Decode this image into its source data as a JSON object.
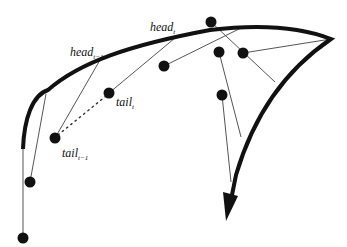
{
  "diagram": {
    "type": "tracking-curve",
    "colors": {
      "curve": "#111111",
      "line": "#555555",
      "dot": "#111111",
      "background": "#ffffff"
    },
    "labels": {
      "head_t": {
        "base": "head",
        "sub": "t"
      },
      "head_tm1": {
        "base": "head",
        "sub": "t−1"
      },
      "tail_t": {
        "base": "tail",
        "sub": "t"
      },
      "tail_tm1": {
        "base": "tail",
        "sub": "t−1"
      }
    },
    "curve": {
      "description": "Thick path starting lower-left, curving up and right to a sharp tip, then sweeping down to an arrowhead",
      "start": [
        23,
        149
      ],
      "tip": [
        331,
        39
      ],
      "arrow_tip": [
        226,
        221
      ]
    },
    "dots": [
      {
        "id": "tail_t",
        "x": 109,
        "y": 93
      },
      {
        "id": "tail_tm1",
        "x": 55,
        "y": 138
      },
      {
        "id": "d1",
        "x": 30,
        "y": 182
      },
      {
        "id": "d2",
        "x": 23,
        "y": 238
      },
      {
        "id": "d3",
        "x": 164,
        "y": 66
      },
      {
        "id": "d4",
        "x": 211,
        "y": 22
      },
      {
        "id": "d5",
        "x": 219,
        "y": 52
      },
      {
        "id": "d6",
        "x": 243,
        "y": 53
      },
      {
        "id": "d7",
        "x": 222,
        "y": 95
      }
    ],
    "connectors": [
      {
        "from": [
          109,
          93
        ],
        "to": [
          175,
          38
        ]
      },
      {
        "from": [
          55,
          138
        ],
        "to": [
          100,
          60
        ]
      },
      {
        "from": [
          30,
          182
        ],
        "to": [
          46,
          94
        ]
      },
      {
        "from": [
          23,
          238
        ],
        "to": [
          23,
          149
        ]
      },
      {
        "from": [
          164,
          66
        ],
        "to": [
          243,
          27
        ]
      },
      {
        "from": [
          211,
          22
        ],
        "to": [
          275,
          82
        ]
      },
      {
        "from": [
          243,
          53
        ],
        "to": [
          331,
          39
        ]
      },
      {
        "from": [
          219,
          52
        ],
        "to": [
          241,
          137
        ]
      },
      {
        "from": [
          222,
          95
        ],
        "to": [
          231,
          182
        ]
      }
    ],
    "dotted_link": {
      "from": [
        55,
        138
      ],
      "to": [
        109,
        93
      ]
    }
  }
}
